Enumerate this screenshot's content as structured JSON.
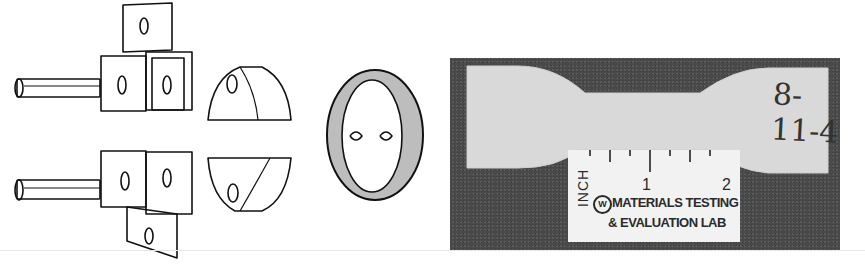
{
  "figure": {
    "left_panel": {
      "description": "Line drawing of tensile test grips with split collar halves and ring",
      "parts": [
        "upper-grip-with-pin",
        "lower-grip-with-pin",
        "upper-half-collar",
        "lower-half-collar",
        "split-ring"
      ]
    },
    "right_panel": {
      "description": "Photograph of dogbone tensile specimen with inch scale",
      "specimen_id": "8-11-4",
      "ruler": {
        "unit_label": "INCH",
        "tick_labels": [
          "1",
          "2"
        ],
        "logo": "W",
        "lab_line1": "MATERIALS TESTING",
        "lab_line2": "& EVALUATION LAB"
      }
    }
  }
}
